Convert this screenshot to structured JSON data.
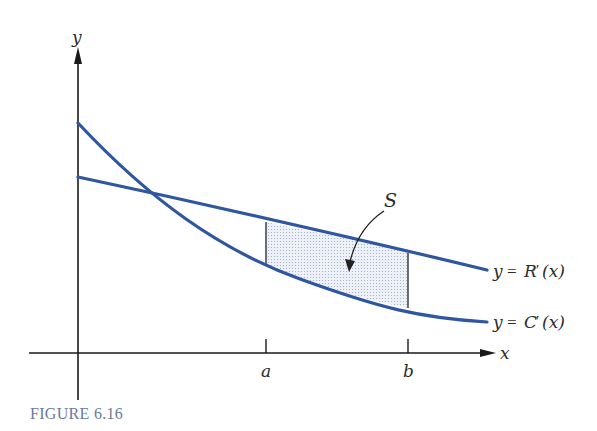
{
  "figure": {
    "caption": "FIGURE 6.16",
    "axes": {
      "x_label": "x",
      "y_label": "y"
    },
    "ticks": {
      "a_label": "a",
      "b_label": "b"
    },
    "region": {
      "label": "S"
    },
    "curves": [
      {
        "id": "revenue",
        "label_y": "y",
        "label_eq": "=",
        "label_fn": "R",
        "label_prime": "′",
        "label_arg": "(x)",
        "color": "#2f56a0"
      },
      {
        "id": "cost",
        "label_y": "y",
        "label_eq": "=",
        "label_fn": "C",
        "label_prime": "′",
        "label_arg": "(x)",
        "color": "#2f56a0"
      }
    ],
    "colors": {
      "curve": "#2f56a0",
      "axis": "#1a1a1a",
      "shade": "#e6ecf5",
      "caption": "#6a7a9a"
    }
  }
}
